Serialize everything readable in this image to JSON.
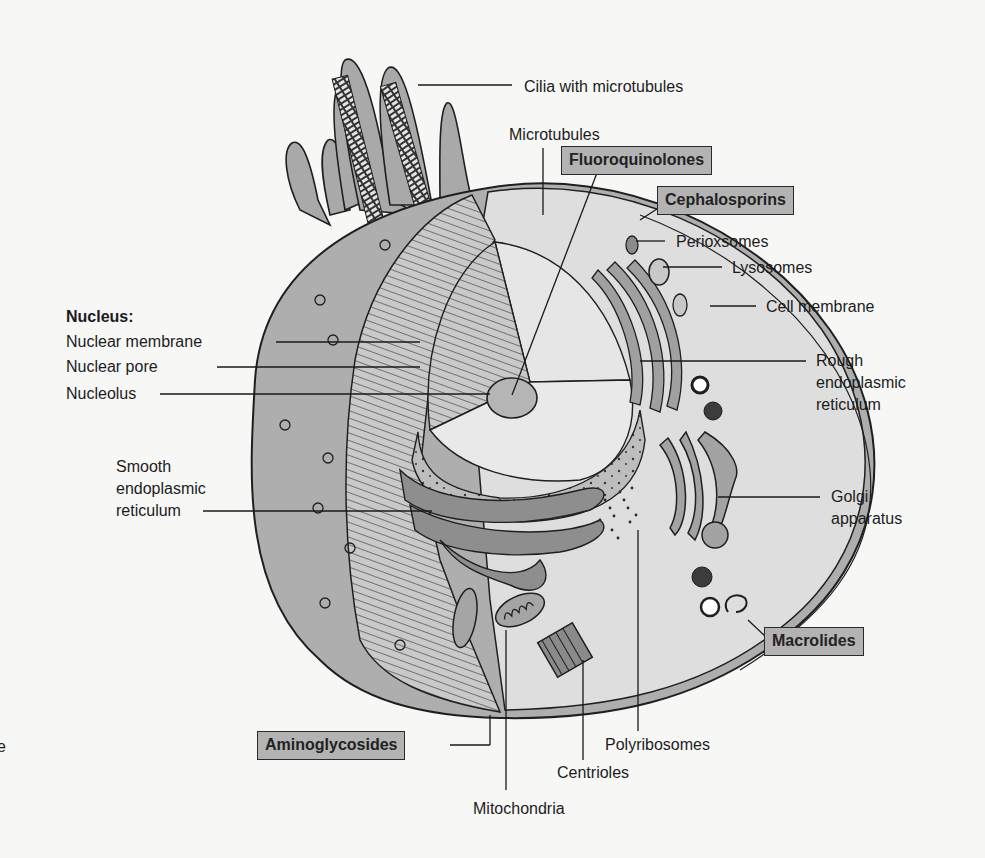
{
  "figure": {
    "colors": {
      "background": "#f7f7f6",
      "cytoplasm_gray": "#aeaeae",
      "interior_light": "#dedede",
      "drug_box_fill": "#b3b3b3",
      "outline": "#1f1f1f"
    }
  },
  "labels": {
    "cilia": "Cilia with microtubules",
    "microtubules": "Microtubules",
    "perioxsomes": "Perioxsomes",
    "lysosomes": "Lysosomes",
    "cell_membrane": "Cell membrane",
    "rough_er": [
      "Rough",
      "endoplasmic",
      "reticulum"
    ],
    "golgi": [
      "Golgi",
      "apparatus"
    ],
    "nucleus_heading": "Nucleus:",
    "nuclear_membrane": "Nuclear membrane",
    "nuclear_pore": "Nuclear pore",
    "nucleolus": "Nucleolus",
    "smooth_er": [
      "Smooth",
      "endoplasmic",
      "reticulum"
    ],
    "polyribosomes": "Polyribosomes",
    "centrioles": "Centrioles",
    "mitochondria": "Mitochondria",
    "edge_fragment": "e"
  },
  "drug_classes": {
    "fluoroquinolones": "Fluoroquinolones",
    "cephalosporins": "Cephalosporins",
    "macrolides": "Macrolides",
    "aminoglycosides": "Aminoglycosides"
  }
}
